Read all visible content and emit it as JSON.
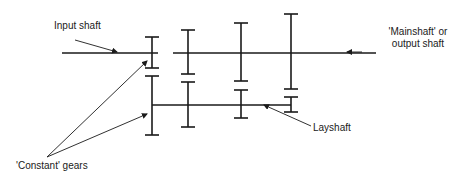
{
  "diagram": {
    "type": "gearbox-schematic",
    "colors": {
      "line": "#1a1a1a",
      "background": "#ffffff"
    },
    "labels": {
      "input_shaft": "Input shaft",
      "mainshaft_line1": "'Mainshaft' or",
      "mainshaft_line2": "output shaft",
      "layshaft": "Layshaft",
      "constant_gears": "'Constant' gears"
    },
    "shafts": [
      {
        "name": "input-shaft",
        "x1": 62,
        "x2": 158,
        "y": 53
      },
      {
        "name": "mainshaft",
        "x1": 173,
        "x2": 376,
        "y": 53
      },
      {
        "name": "layshaft",
        "x1": 152,
        "x2": 291,
        "y": 105
      }
    ],
    "gears": [
      {
        "name": "input-constant-gear",
        "x": 152,
        "y1": 37,
        "y2": 68
      },
      {
        "name": "layshaft-constant-gear",
        "x": 152,
        "y1": 76,
        "y2": 135
      },
      {
        "name": "mainshaft-gear-2",
        "x": 188,
        "y1": 30,
        "y2": 74
      },
      {
        "name": "layshaft-gear-2",
        "x": 188,
        "y1": 82,
        "y2": 127
      },
      {
        "name": "mainshaft-gear-3",
        "x": 241,
        "y1": 23,
        "y2": 81
      },
      {
        "name": "layshaft-gear-3",
        "x": 241,
        "y1": 90,
        "y2": 118
      },
      {
        "name": "mainshaft-gear-4",
        "x": 291,
        "y1": 14,
        "y2": 89
      },
      {
        "name": "layshaft-gear-4",
        "x": 291,
        "y1": 97,
        "y2": 112
      }
    ]
  }
}
